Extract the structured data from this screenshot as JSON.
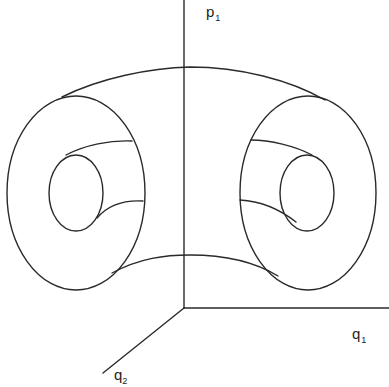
{
  "diagram": {
    "type": "phase-space torus (invariant torus in 3D projection)",
    "axes": {
      "vertical": {
        "label": "p",
        "subscript": "1"
      },
      "horizontal": {
        "label": "q",
        "subscript": "1"
      },
      "diagonal": {
        "label": "q",
        "subscript": "2"
      }
    },
    "shapes": [
      "torus-outer-surface",
      "left-cross-section-outer",
      "left-cross-section-inner",
      "right-cross-section-outer",
      "right-cross-section-inner"
    ],
    "colors": {
      "line": "#2a2a2a",
      "background": "#ffffff"
    }
  }
}
